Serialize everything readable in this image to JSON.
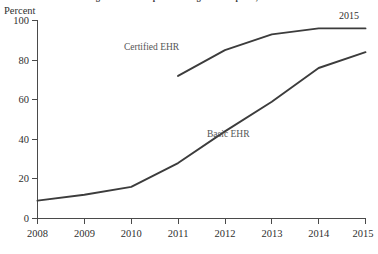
{
  "chart": {
    "title_clipped": "Figure. EHR Adoption Among U.S. Hospitals, 2008-2015",
    "y_axis_unit_label": "Percent",
    "annotation_year": "2015"
  },
  "chart_data": {
    "type": "line",
    "title": "",
    "xlabel": "",
    "ylabel": "Percent",
    "x": [
      2008,
      2009,
      2010,
      2011,
      2012,
      2013,
      2014,
      2015
    ],
    "xticklabels": [
      "2008",
      "2009",
      "2010",
      "2011",
      "2012",
      "2013",
      "2014",
      "2015"
    ],
    "xlim": [
      2008,
      2015
    ],
    "ylim": [
      0,
      100
    ],
    "yticks": [
      0,
      20,
      40,
      60,
      80,
      100
    ],
    "yticklabels": [
      "0",
      "20",
      "40",
      "60",
      "80",
      "100"
    ],
    "grid": false,
    "legend": "inline-labels",
    "series": [
      {
        "name": "Certified EHR",
        "label": "Certified EHR",
        "color": "#3c3c3c",
        "x": [
          2011,
          2012,
          2013,
          2014,
          2015
        ],
        "values": [
          72,
          85,
          93,
          96,
          96
        ]
      },
      {
        "name": "Basic EHR",
        "label": "Basic EHR",
        "color": "#3c3c3c",
        "x": [
          2008,
          2009,
          2010,
          2011,
          2012,
          2013,
          2014,
          2015
        ],
        "values": [
          9,
          12,
          16,
          28,
          44,
          59,
          76,
          84
        ]
      }
    ],
    "annotations": [
      {
        "text": "Certified EHR",
        "x": 2011.6,
        "y": 78
      },
      {
        "text": "Basic EHR",
        "x": 2012.5,
        "y": 38
      },
      {
        "text": "2015",
        "x": 2014.85,
        "y": 99
      }
    ]
  }
}
